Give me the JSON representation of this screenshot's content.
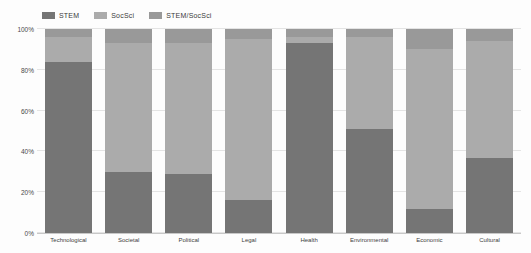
{
  "figure": {
    "background": "#fdfdfd"
  },
  "colors": {
    "grid": "#e4e4e4",
    "axis_line": "#c8c8c8",
    "tick_text": "#4a4a4a",
    "legend_text": "#3a3a3a"
  },
  "chart_data": {
    "type": "bar",
    "variant": "100%-stacked-vertical",
    "title": "",
    "xlabel": "",
    "ylabel": "",
    "grid": true,
    "legend_position": "top-left",
    "ylim": [
      0,
      100
    ],
    "y_ticks": [
      "0%",
      "20%",
      "40%",
      "60%",
      "80%",
      "100%"
    ],
    "categories": [
      "Technological",
      "Societal",
      "Political",
      "Legal",
      "Health",
      "Environmental",
      "Economic",
      "Cultural"
    ],
    "series": [
      {
        "name": "STEM",
        "color": "#757575",
        "values": [
          84,
          30,
          29,
          16,
          93,
          51,
          12,
          37
        ]
      },
      {
        "name": "SocSci",
        "color": "#ababab",
        "values": [
          12,
          63,
          64,
          79,
          3,
          45,
          78,
          57
        ]
      },
      {
        "name": "STEM/SocSci",
        "color": "#999999",
        "values": [
          4,
          7,
          7,
          5,
          4,
          4,
          10,
          6
        ]
      }
    ]
  }
}
